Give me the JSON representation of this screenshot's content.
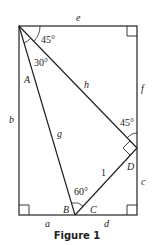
{
  "figure": {
    "caption": "Figure 1",
    "labels": {
      "e": "e",
      "f": "f",
      "b": "b",
      "c": "c",
      "a": "a",
      "d": "d",
      "h": "h",
      "g": "g",
      "A": "A",
      "B": "B",
      "C": "C",
      "D": "D",
      "one": "1"
    },
    "angles": {
      "top_left": "45°",
      "inner_top": "30°",
      "at_D": "45°",
      "at_B": "60°"
    },
    "colors": {
      "stroke": "#222222",
      "text": "#222222",
      "background": "#ffffff"
    }
  }
}
